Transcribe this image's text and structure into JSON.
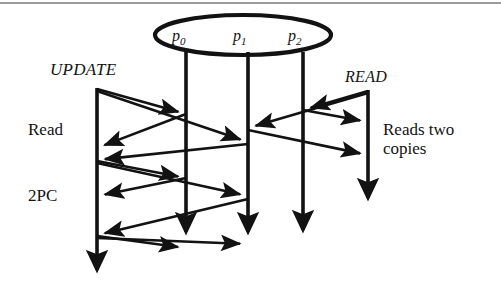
{
  "figure": {
    "type": "sequence-diagram",
    "background": "#ffffff",
    "ink_color": "#121212",
    "rule_color": "#9b9b9b"
  },
  "group": {
    "name": "replica-group-ellipse",
    "shape": "ellipse",
    "cx": 243,
    "cy": 35,
    "rx": 88,
    "ry": 20
  },
  "nodes": [
    {
      "id": "p0",
      "base": "p",
      "sub": "0",
      "x": 186,
      "label_x": 172,
      "label_y": 27
    },
    {
      "id": "p1",
      "base": "p",
      "sub": "1",
      "x": 248,
      "label_x": 233,
      "label_y": 27
    },
    {
      "id": "p2",
      "base": "p",
      "sub": "2",
      "x": 303,
      "label_x": 288,
      "label_y": 27
    }
  ],
  "lifelines": [
    {
      "name": "update-client-lifeline",
      "x": 97,
      "y_top": 88,
      "y_bottom": 286,
      "arrow_end": true
    },
    {
      "name": "p0-lifeline",
      "x": 186,
      "y_top": 52,
      "y_bottom": 248,
      "arrow_end": true
    },
    {
      "name": "p1-lifeline",
      "x": 248,
      "y_top": 52,
      "y_bottom": 248,
      "arrow_end": true
    },
    {
      "name": "p2-lifeline",
      "x": 303,
      "y_top": 52,
      "y_bottom": 246,
      "arrow_end": true
    },
    {
      "name": "read-client-lifeline",
      "x": 368,
      "y_top": 90,
      "y_bottom": 214,
      "arrow_end": true
    }
  ],
  "labels": {
    "update": "UPDATE",
    "read": "READ",
    "phase_read": "Read",
    "phase_2pc": "2PC",
    "note_line1": "Reads two",
    "note_line2": "copies"
  },
  "label_positions": {
    "update": {
      "x": 50,
      "y": 60
    },
    "read": {
      "x": 345,
      "y": 68
    },
    "phase_read": {
      "x": 28,
      "y": 120
    },
    "phase_2pc": {
      "x": 28,
      "y": 186
    },
    "note": {
      "x": 383,
      "y": 120
    }
  },
  "messages": [
    {
      "name": "update-to-p0-prepare",
      "from": "update-client",
      "to": "p0",
      "x1": 97,
      "y1": 89,
      "x2": 186,
      "y2": 114
    },
    {
      "name": "update-to-p1-prepare",
      "from": "update-client",
      "to": "p1",
      "x1": 97,
      "y1": 91,
      "x2": 248,
      "y2": 142
    },
    {
      "name": "p0-to-update-reply",
      "from": "p0",
      "to": "update-client",
      "x1": 186,
      "y1": 114,
      "x2": 97,
      "y2": 148
    },
    {
      "name": "p1-to-update-reply",
      "from": "p1",
      "to": "update-client",
      "x1": 248,
      "y1": 144,
      "x2": 97,
      "y2": 160
    },
    {
      "name": "update-to-p0-commit",
      "from": "update-client",
      "to": "p0",
      "x1": 97,
      "y1": 161,
      "x2": 186,
      "y2": 178
    },
    {
      "name": "update-to-p1-commit",
      "from": "update-client",
      "to": "p1",
      "x1": 97,
      "y1": 163,
      "x2": 248,
      "y2": 196
    },
    {
      "name": "p0-to-update-ack",
      "from": "p0",
      "to": "update-client",
      "x1": 186,
      "y1": 178,
      "x2": 97,
      "y2": 196
    },
    {
      "name": "p1-to-update-ack",
      "from": "p1",
      "to": "update-client",
      "x1": 248,
      "y1": 199,
      "x2": 97,
      "y2": 235
    },
    {
      "name": "update-to-p0-final",
      "from": "update-client",
      "to": "p0",
      "x1": 97,
      "y1": 236,
      "x2": 186,
      "y2": 248
    },
    {
      "name": "update-to-p1-final",
      "from": "update-client",
      "to": "p1",
      "x1": 97,
      "y1": 238,
      "x2": 248,
      "y2": 244
    },
    {
      "name": "read-to-p2-request",
      "from": "read-client",
      "to": "p2",
      "x1": 368,
      "y1": 91,
      "x2": 303,
      "y2": 110
    },
    {
      "name": "read-to-p1-request",
      "from": "read-client",
      "to": "p1",
      "x1": 368,
      "y1": 93,
      "x2": 248,
      "y2": 128
    },
    {
      "name": "p2-to-read-reply",
      "from": "p2",
      "to": "read-client",
      "x1": 303,
      "y1": 110,
      "x2": 368,
      "y2": 122
    },
    {
      "name": "p1-to-read-reply",
      "from": "p1",
      "to": "read-client",
      "x1": 248,
      "y1": 130,
      "x2": 368,
      "y2": 155
    }
  ]
}
